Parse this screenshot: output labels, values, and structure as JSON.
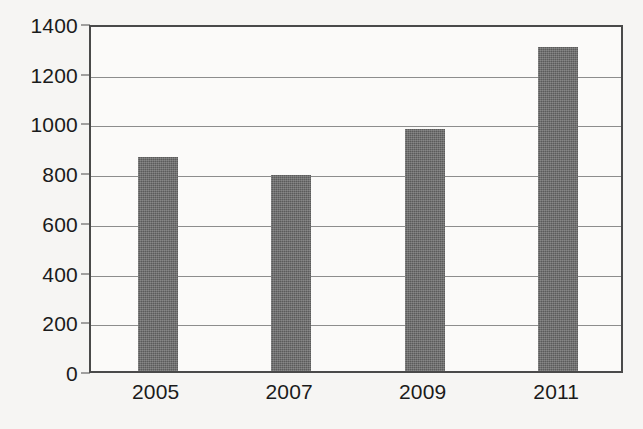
{
  "chart_data": {
    "type": "bar",
    "title": "",
    "subtitle": "",
    "xlabel": "",
    "ylabel": "",
    "categories": [
      "2005",
      "2007",
      "2009",
      "2011"
    ],
    "values": [
      860,
      790,
      975,
      1305
    ],
    "series": [
      {
        "name": "",
        "values": [
          860,
          790,
          975,
          1305
        ]
      }
    ],
    "ylim": [
      0,
      1400
    ],
    "y_ticks": [
      0,
      200,
      400,
      600,
      800,
      1000,
      1200,
      1400
    ],
    "y_tick_labels": [
      "0",
      "200",
      "400",
      "600",
      "800",
      "1000",
      "1200",
      "1400"
    ],
    "x_tick_labels": [
      "2005",
      "2007",
      "2009",
      "2011"
    ],
    "grid": true,
    "grid_axis": "y",
    "legend": false,
    "legend_position": "none",
    "bar_color": "#5b5b5b",
    "axis_color": "#4a4a4a",
    "grid_color": "#8d8d8d",
    "background_color": "#f6f5f3",
    "plot_background_color": "#fbfaf9",
    "text_color": "#1b1b1b",
    "annotations": []
  }
}
